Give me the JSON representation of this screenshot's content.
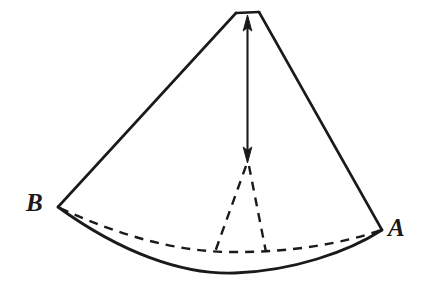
{
  "figure": {
    "background_color": "#ffffff",
    "stroke_color": "#1a1a1a",
    "labels": {
      "vertex_b": "B",
      "vertex_a": "A"
    },
    "geometry": {
      "apex_left": [
        236,
        12
      ],
      "apex_right": [
        259,
        12
      ],
      "vertex_b": [
        58,
        207
      ],
      "vertex_a": [
        382,
        230
      ],
      "base_curve_lowest_point": [
        235,
        273
      ],
      "arrow_top": [
        247,
        18
      ],
      "arrow_bottom": [
        247,
        162
      ],
      "dashed_v_left_foot": [
        215,
        252
      ],
      "dashed_v_right_foot": [
        265,
        252
      ]
    },
    "elements": {
      "apex_top_edge": "flat-apex-segment",
      "left_edge": "solid-edge-apex-to-b",
      "right_edge": "solid-edge-apex-to-a",
      "base_front_arc": "solid-curved-base-front",
      "base_back_arc": "dashed-curved-base-back",
      "center_axis_arrow": "double-headed-vertical-arrow",
      "hidden_edges": "dashed-v-to-base-center"
    }
  }
}
